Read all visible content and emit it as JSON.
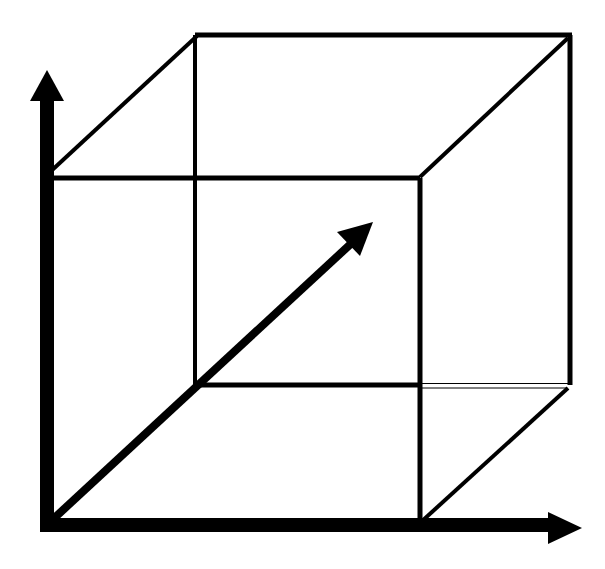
{
  "diagram": {
    "title": "",
    "colors": {
      "background": "#ffffff",
      "stroke": "#000000"
    },
    "labels": []
  }
}
